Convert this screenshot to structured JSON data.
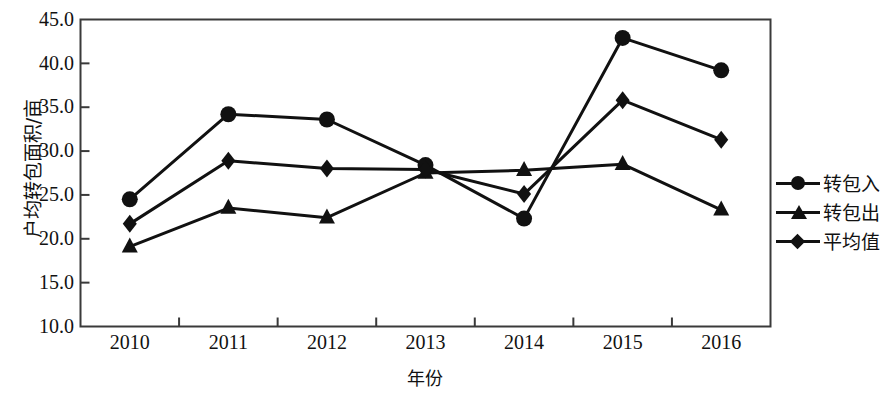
{
  "chart_data": {
    "type": "line",
    "title": "",
    "xlabel": "年份",
    "ylabel": "户均转包面积/亩",
    "categories": [
      "2010",
      "2011",
      "2012",
      "2013",
      "2014",
      "2015",
      "2016"
    ],
    "x": [
      2010,
      2011,
      2012,
      2013,
      2014,
      2015,
      2016
    ],
    "ylim": [
      10.0,
      45.0
    ],
    "yticks": [
      "10.0",
      "15.0",
      "20.0",
      "25.0",
      "30.0",
      "35.0",
      "40.0",
      "45.0"
    ],
    "ytick_values": [
      10.0,
      15.0,
      20.0,
      25.0,
      30.0,
      35.0,
      40.0,
      45.0
    ],
    "grid": false,
    "legend_position": "right",
    "series": [
      {
        "name": "转包入",
        "marker": "circle",
        "color": "#111111",
        "values": [
          24.5,
          34.2,
          33.6,
          28.4,
          22.3,
          42.9,
          39.2
        ]
      },
      {
        "name": "转包出",
        "marker": "triangle",
        "color": "#111111",
        "values": [
          19.1,
          23.5,
          22.4,
          27.5,
          27.8,
          28.5,
          23.3
        ]
      },
      {
        "name": "平均值",
        "marker": "diamond",
        "color": "#111111",
        "values": [
          21.7,
          28.9,
          28.0,
          27.9,
          25.1,
          35.8,
          31.3
        ]
      }
    ]
  },
  "legend": {
    "items": [
      {
        "label": "转包入",
        "marker": "circle"
      },
      {
        "label": "转包出",
        "marker": "triangle"
      },
      {
        "label": "平均值",
        "marker": "diamond"
      }
    ]
  },
  "axes": {
    "y_title": "户均转包面积/亩",
    "x_title": "年份",
    "y_labels": [
      "45.0",
      "40.0",
      "35.0",
      "30.0",
      "25.0",
      "20.0",
      "15.0",
      "10.0"
    ],
    "x_labels": [
      "2010",
      "2011",
      "2012",
      "2013",
      "2014",
      "2015",
      "2016"
    ]
  },
  "colors": {
    "ink": "#111111",
    "background": "#ffffff"
  }
}
